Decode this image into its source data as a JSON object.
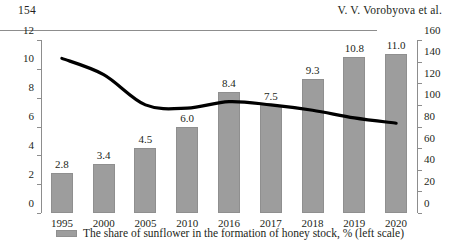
{
  "header": {
    "page_number": "154",
    "authors": "V. V. Vorobyova et al."
  },
  "legend": {
    "series_label": "The share of sunflower in the formation of honey stock, % (left scale)",
    "swatch_color": "#9d9d9d"
  },
  "chart_data": {
    "type": "bar",
    "title": "",
    "subtitle": "",
    "xlabel": "",
    "ylabel": "",
    "grid": false,
    "legend_position": "bottom",
    "categories": [
      "1995",
      "2000",
      "2005",
      "2010",
      "2016",
      "2017",
      "2018",
      "2019",
      "2020"
    ],
    "series": [
      {
        "name": "The share of sunflower in the formation of honey stock, % (left scale)",
        "type": "bar",
        "axis": "left",
        "color": "#9d9d9d",
        "values": [
          2.8,
          3.4,
          4.5,
          6.0,
          8.4,
          7.5,
          9.3,
          10.8,
          11.0
        ],
        "labels": [
          "2.8",
          "3.4",
          "4.5",
          "6.0",
          "8.4",
          "7.5",
          "9.3",
          "10.8",
          "11.0"
        ]
      },
      {
        "name": "line-series (right scale)",
        "type": "line",
        "axis": "right",
        "color": "#000000",
        "values": [
          143,
          128,
          100,
          97,
          103,
          100,
          95,
          88,
          83
        ],
        "labels": []
      }
    ],
    "left_axis": {
      "ylim": [
        0,
        12
      ],
      "ticks": [
        0,
        2,
        4,
        6,
        8,
        10,
        12
      ],
      "tick_labels": [
        "0",
        "2",
        "4",
        "6",
        "8",
        "10",
        "12"
      ]
    },
    "right_axis": {
      "ylim": [
        0,
        160
      ],
      "ticks": [
        0,
        20,
        40,
        60,
        80,
        100,
        120,
        140,
        160
      ],
      "tick_labels": [
        "0",
        "20",
        "40",
        "60",
        "80",
        "100",
        "120",
        "140",
        "160"
      ]
    }
  }
}
